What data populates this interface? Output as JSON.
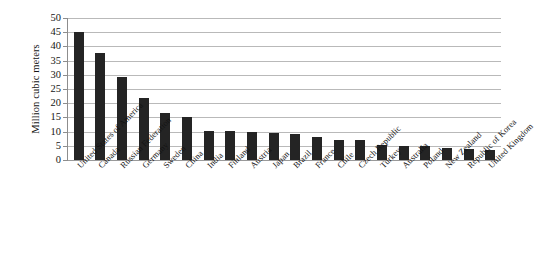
{
  "chart_data": {
    "type": "bar",
    "title": "",
    "xlabel": "",
    "ylabel": "Million cubic meters",
    "ylim": [
      0,
      50
    ],
    "yticks": [
      0,
      5,
      10,
      15,
      20,
      25,
      30,
      35,
      40,
      45,
      50
    ],
    "ytick_labels": [
      "0",
      "5",
      "10",
      "15",
      "20",
      "25",
      "30",
      "35",
      "40",
      "45",
      "50"
    ],
    "grid": true,
    "legend": false,
    "bar_color": "#242424",
    "categories": [
      "United States of America",
      "Canada",
      "Russian Federation",
      "Germany",
      "Sweden",
      "China",
      "India",
      "Finland",
      "Austria",
      "Japan",
      "Brazil",
      "France",
      "Chile",
      "Czech Republic",
      "Turkey",
      "Australia",
      "Poland",
      "New Zealand",
      "Republic of Korea",
      "United Kingdom"
    ],
    "values": [
      45.1,
      37.8,
      29.1,
      21.7,
      16.6,
      15.0,
      10.1,
      10.1,
      9.8,
      9.4,
      9.3,
      8.0,
      7.0,
      7.2,
      5.2,
      5.0,
      4.8,
      4.2,
      4.0,
      3.6
    ]
  },
  "axis": {
    "y_title": "Million cubic meters"
  }
}
